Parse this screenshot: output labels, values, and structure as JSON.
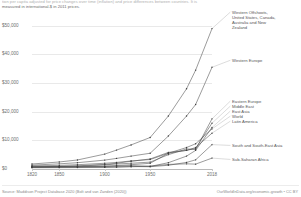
{
  "subtitle": {
    "line1": "tion per capita adjusted for price changes over time (inflation) and price differences between countries. It is",
    "line2": "measured in international-$ in 2011 prices."
  },
  "footer": {
    "source": "Source: Maddison Project Database 2020 (Bolt and van Zanden (2020))",
    "credit": "OurWorldInData.org/economic-growth • CC BY"
  },
  "chart_data": {
    "type": "line",
    "title": "",
    "subtitle": "GDP per capita adjusted for price changes over time (inflation) and price differences between countries. It is measured in international-$ in 2011 prices.",
    "xlabel": "",
    "ylabel": "",
    "xlim": [
      1820,
      2018
    ],
    "ylim": [
      0,
      52000
    ],
    "grid": true,
    "legend_position": "right-inline-labels",
    "y_ticks": [
      0,
      10000,
      20000,
      30000,
      40000,
      50000
    ],
    "y_tick_labels": [
      "$0",
      "$10,000",
      "$20,000",
      "$30,000",
      "$40,000",
      "$50,000"
    ],
    "x_ticks": [
      1820,
      1850,
      1900,
      1950,
      2018
    ],
    "x_tick_labels": [
      "1820",
      "1850",
      "1900",
      "1950",
      "2018"
    ],
    "x": [
      1820,
      1850,
      1870,
      1900,
      1913,
      1929,
      1950,
      1970,
      1990,
      2000,
      2018
    ],
    "series": [
      {
        "name": "Western Offshoots, United States, Canada, Australia and New Zealand",
        "label": "Western Offshoots,\nUnited States, Canada,\nAustralia and New\nZealand",
        "values": [
          1750,
          2450,
          3150,
          5200,
          6600,
          8400,
          11000,
          18500,
          28000,
          34500,
          49000
        ]
      },
      {
        "name": "Western Europe",
        "label": "Western Europe",
        "values": [
          1350,
          1800,
          2200,
          3100,
          3700,
          4500,
          5500,
          11500,
          18500,
          22500,
          35500
        ]
      },
      {
        "name": "Eastern Europe",
        "label": "Eastern Europe",
        "values": [
          700,
          850,
          1000,
          1450,
          1750,
          2000,
          2400,
          5000,
          7000,
          6800,
          17500
        ]
      },
      {
        "name": "Middle East",
        "label": "Middle East",
        "values": [
          650,
          720,
          800,
          1000,
          1200,
          1500,
          2000,
          5500,
          6500,
          7200,
          16000
        ]
      },
      {
        "name": "East Asia",
        "label": "East Asia",
        "values": [
          750,
          780,
          800,
          900,
          1000,
          1200,
          900,
          2200,
          4500,
          6500,
          14500
        ]
      },
      {
        "name": "World",
        "label": "World",
        "values": [
          1100,
          1250,
          1500,
          2000,
          2300,
          2800,
          3300,
          5500,
          7500,
          8800,
          14000
        ]
      },
      {
        "name": "Latin America",
        "label": "Latin America",
        "values": [
          800,
          900,
          1100,
          1600,
          2000,
          2700,
          3500,
          5800,
          6500,
          7500,
          12500
        ]
      },
      {
        "name": "South and South-East Asia",
        "label": "South and South-East Asia",
        "values": [
          600,
          620,
          650,
          700,
          750,
          850,
          800,
          1300,
          2300,
          3200,
          8500
        ]
      },
      {
        "name": "Sub-Saharan Africa",
        "label": "Sub-Saharan Africa",
        "values": [
          450,
          470,
          500,
          550,
          650,
          800,
          1000,
          1600,
          1800,
          1700,
          3800
        ]
      }
    ]
  }
}
